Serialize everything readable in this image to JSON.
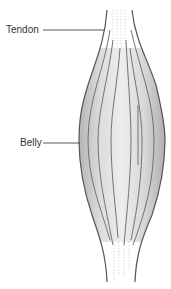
{
  "diagram": {
    "labels": [
      {
        "id": "tendon",
        "text": "Tendon"
      },
      {
        "id": "belly",
        "text": "Belly"
      }
    ]
  },
  "colors": {
    "outline": "#555555",
    "fiber": "#666666",
    "fill_light": "#eeeeee",
    "fill_dark": "#bdbdbd",
    "label_text": "#333333",
    "leader_line": "#444444"
  }
}
